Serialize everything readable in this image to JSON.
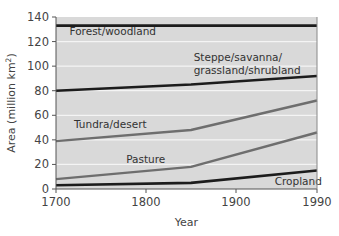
{
  "chart_data": {
    "type": "line",
    "title": "",
    "xlabel": "Year",
    "ylabel": "Area (million km²)",
    "ylabel_parts": {
      "main": "Area (million km",
      "sup": "2",
      "end": ")"
    },
    "xlim": [
      1700,
      1990
    ],
    "ylim": [
      0,
      140
    ],
    "x_ticks": [
      1700,
      1800,
      1900,
      1990
    ],
    "y_ticks": [
      0,
      20,
      40,
      60,
      80,
      100,
      120,
      140
    ],
    "grid": {
      "horizontal": true,
      "color": "#f4f4f4"
    },
    "plot_background": "#d9d9d9",
    "legend": "inline labels",
    "series": [
      {
        "name": "Forest/woodland",
        "label_lines": [
          "Forest/woodland"
        ],
        "color": "#1c1c1c",
        "width": 2.6,
        "x": [
          1700,
          1850,
          1990
        ],
        "values": [
          133,
          133,
          133
        ],
        "label_pos": {
          "x": 1715,
          "y": 125
        }
      },
      {
        "name": "Steppe/savanna/grassland/shrubland",
        "label_lines": [
          "Steppe/savanna/",
          "grassland/shrubland"
        ],
        "color": "#1c1c1c",
        "width": 2.6,
        "x": [
          1700,
          1850,
          1990
        ],
        "values": [
          80,
          85,
          92
        ],
        "label_pos": {
          "x": 1853,
          "y": 104
        }
      },
      {
        "name": "Tundra/desert",
        "label_lines": [
          "Tundra/desert"
        ],
        "color": "#6e6e6e",
        "width": 2.4,
        "x": [
          1700,
          1850,
          1990
        ],
        "values": [
          39,
          48,
          72
        ],
        "label_pos": {
          "x": 1720,
          "y": 50
        }
      },
      {
        "name": "Pasture",
        "label_lines": [
          "Pasture"
        ],
        "color": "#6e6e6e",
        "width": 2.4,
        "x": [
          1700,
          1850,
          1990
        ],
        "values": [
          8,
          18,
          46
        ],
        "label_pos": {
          "x": 1778,
          "y": 21
        }
      },
      {
        "name": "Cropland",
        "label_lines": [
          "Cropland"
        ],
        "color": "#1c1c1c",
        "width": 2.6,
        "x": [
          1700,
          1850,
          1990
        ],
        "values": [
          3,
          5,
          15
        ],
        "label_pos": {
          "x": 1943,
          "y": 3
        }
      }
    ]
  }
}
